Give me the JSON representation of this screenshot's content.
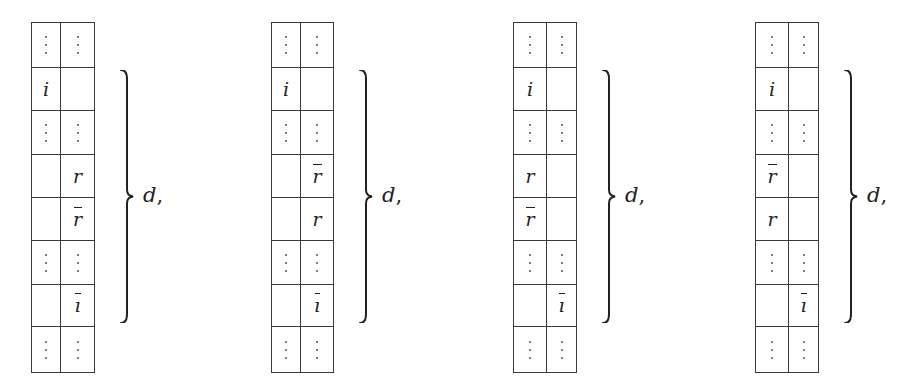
{
  "figure": {
    "line_color": "#3a3a3a",
    "text_color": "#222222",
    "row_heights": [
      45,
      43,
      44,
      43,
      43,
      44,
      42,
      46
    ],
    "panels": [
      {
        "left": 31,
        "col_widths": [
          29,
          34
        ],
        "rows": [
          [
            "⋮",
            "⋮"
          ],
          [
            "i",
            ""
          ],
          [
            "⋮",
            "⋮"
          ],
          [
            "",
            "r"
          ],
          [
            "",
            "r̄"
          ],
          [
            "⋮",
            "⋮"
          ],
          [
            "",
            "ī"
          ],
          [
            "⋮",
            "⋮"
          ]
        ],
        "brace_label": "d",
        "punctuation": ","
      },
      {
        "left": 271,
        "col_widths": [
          29,
          33
        ],
        "rows": [
          [
            "⋮",
            "⋮"
          ],
          [
            "i",
            ""
          ],
          [
            "⋮",
            "⋮"
          ],
          [
            "",
            "r̄"
          ],
          [
            "",
            "r"
          ],
          [
            "⋮",
            "⋮"
          ],
          [
            "",
            "ī"
          ],
          [
            "⋮",
            "⋮"
          ]
        ],
        "brace_label": "d",
        "punctuation": ","
      },
      {
        "left": 513,
        "col_widths": [
          33,
          30
        ],
        "rows": [
          [
            "⋮",
            "⋮"
          ],
          [
            "i",
            ""
          ],
          [
            "⋮",
            "⋮"
          ],
          [
            "r",
            ""
          ],
          [
            "r̄",
            ""
          ],
          [
            "⋮",
            "⋮"
          ],
          [
            "",
            "ī"
          ],
          [
            "⋮",
            "⋮"
          ]
        ],
        "brace_label": "d",
        "punctuation": ","
      },
      {
        "left": 755,
        "col_widths": [
          33,
          30
        ],
        "rows": [
          [
            "⋮",
            "⋮"
          ],
          [
            "i",
            ""
          ],
          [
            "⋮",
            "⋮"
          ],
          [
            "r̄",
            ""
          ],
          [
            "r",
            ""
          ],
          [
            "⋮",
            "⋮"
          ],
          [
            "",
            "ī"
          ],
          [
            "⋮",
            "⋮"
          ]
        ],
        "brace_label": "d",
        "punctuation": ","
      }
    ]
  }
}
